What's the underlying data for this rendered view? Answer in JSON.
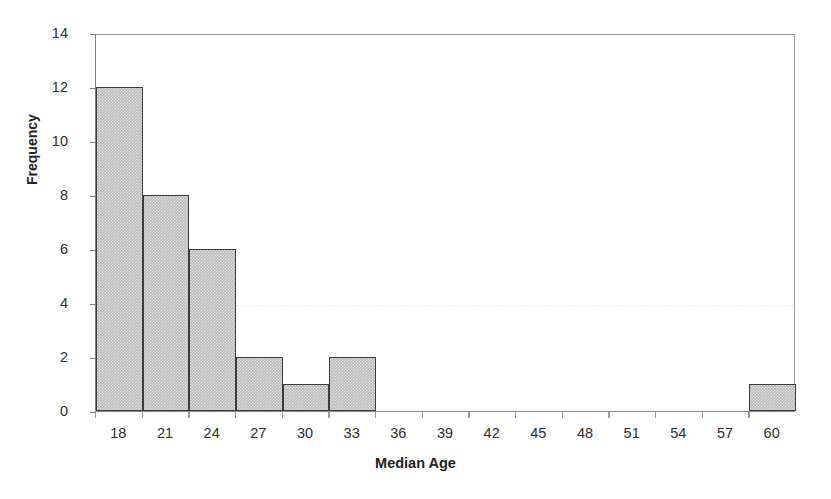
{
  "chart_data": {
    "type": "bar",
    "title": "",
    "subtitle": "",
    "xlabel": "Median Age",
    "ylabel": "Frequency",
    "categories": [
      "18",
      "21",
      "24",
      "27",
      "30",
      "33",
      "36",
      "39",
      "42",
      "45",
      "48",
      "51",
      "54",
      "57",
      "60"
    ],
    "values": [
      12,
      8,
      6,
      2,
      1,
      2,
      0,
      0,
      0,
      0,
      0,
      0,
      0,
      0,
      1
    ],
    "xlim": [
      16.5,
      61.5
    ],
    "ylim": [
      0,
      14
    ],
    "ytick_labels": [
      "0",
      "2",
      "4",
      "6",
      "8",
      "10",
      "12",
      "14"
    ],
    "ytick_values": [
      0,
      2,
      4,
      6,
      8,
      10,
      12,
      14
    ],
    "grid": "faint horizontal gridline at y=4",
    "legend": "none",
    "bar_fill_color": "#b9b9b9",
    "bar_border_color": "#3b3b3b",
    "axis_color": "#7e7e7e",
    "background_color": "#ffffff"
  },
  "axis": {
    "x_title": "Median Age",
    "y_title": "Frequency"
  }
}
